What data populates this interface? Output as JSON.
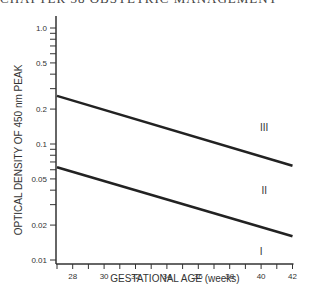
{
  "header": {
    "text": "CHAPTER 38 OBSTETRIC MANAGEMENT"
  },
  "chart_data": {
    "type": "line",
    "title": "",
    "xlabel": "GESTATIONAL AGE (weeks)",
    "ylabel": "OPTICAL DENSITY OF 450 nm PEAK",
    "xlim": [
      27,
      42
    ],
    "ylim": [
      0.01,
      1.2
    ],
    "yscale": "log",
    "x_ticks": [
      28,
      30,
      32,
      34,
      36,
      38,
      40,
      42
    ],
    "y_ticks": [
      0.01,
      0.02,
      0.05,
      0.1,
      0.2,
      0.5,
      1.0
    ],
    "y_tick_labels": [
      "0.01",
      "0.02",
      "0.05",
      "0.1",
      "0.2",
      "0.5",
      "1.0"
    ],
    "grid": false,
    "series": [
      {
        "name": "Zone II/III boundary",
        "x": [
          27,
          42
        ],
        "values": [
          0.26,
          0.065
        ]
      },
      {
        "name": "Zone I/II boundary",
        "x": [
          27,
          42
        ],
        "values": [
          0.063,
          0.016
        ]
      }
    ],
    "annotations": [
      {
        "text": "III",
        "x": 40.2,
        "y": 0.14
      },
      {
        "text": "II",
        "x": 40.2,
        "y": 0.04
      },
      {
        "text": "I",
        "x": 40.0,
        "y": 0.012
      }
    ]
  }
}
